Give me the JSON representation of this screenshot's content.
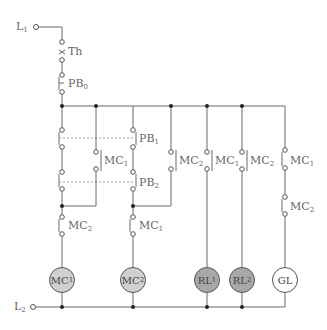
{
  "terminals": {
    "l1": "L",
    "l1_sub": "1",
    "l2": "L",
    "l2_sub": "2"
  },
  "contacts": {
    "th": "Th",
    "pb0": "PB",
    "pb0_sub": "0",
    "pb1": "PB",
    "pb1_sub": "1",
    "pb2": "PB",
    "pb2_sub": "2",
    "mc1_hold": "MC",
    "mc1_hold_sub": "1",
    "mc2_interlock_a": "MC",
    "mc2_interlock_a_sub": "2",
    "mc1_interlock_b": "MC",
    "mc1_interlock_b_sub": "1",
    "mc2_hold": "MC",
    "mc2_hold_sub": "2",
    "mc1_rl1": "MC",
    "mc1_rl1_sub": "1",
    "mc2_rl2": "MC",
    "mc2_rl2_sub": "2",
    "mc1_gl": "MC",
    "mc1_gl_sub": "1",
    "mc2_gl": "MC",
    "mc2_gl_sub": "2"
  },
  "loads": [
    {
      "label": "MC",
      "sub": "1",
      "fill": "#d0d0d0"
    },
    {
      "label": "MC",
      "sub": "2",
      "fill": "#d0d0d0"
    },
    {
      "label": "RL",
      "sub": "1",
      "fill": "#a8a8a8"
    },
    {
      "label": "RL",
      "sub": "2",
      "fill": "#a8a8a8"
    },
    {
      "label": "GL",
      "sub": "",
      "fill": "#ffffff"
    }
  ]
}
